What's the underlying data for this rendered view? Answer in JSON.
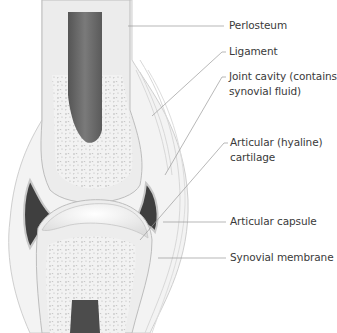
{
  "diagram": {
    "labels": [
      {
        "id": "periosteum",
        "line1": "Perlosteum",
        "line2": ""
      },
      {
        "id": "ligament",
        "line1": "Ligament",
        "line2": ""
      },
      {
        "id": "joint-cavity",
        "line1": "Joint cavity (contains",
        "line2": "synovial fluid)"
      },
      {
        "id": "articular-cartilage",
        "line1": "Articular (hyaline)",
        "line2": "cartilage"
      },
      {
        "id": "articular-capsule",
        "line1": "Articular capsule",
        "line2": ""
      },
      {
        "id": "synovial-membrane",
        "line1": "Synovial membrane",
        "line2": ""
      }
    ],
    "colors": {
      "bone_outer": "#e9e9e9",
      "spongy_bone": "#f1f1f1",
      "marrow": "#6d6d6d",
      "cavity": "#4a4a4a",
      "cartilage": "#f6f6f6",
      "leader_line": "#9a9a9a",
      "text": "#3a3a3a"
    }
  }
}
